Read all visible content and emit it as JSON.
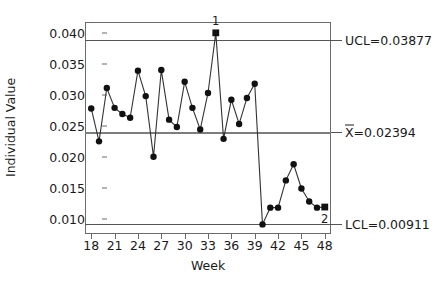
{
  "chart_data": {
    "type": "line",
    "title": "",
    "xlabel": "Week",
    "ylabel": "Individual Value",
    "xlim": [
      17.2,
      48.8
    ],
    "ylim": [
      0.00755,
      0.04175
    ],
    "grid": false,
    "legend": "none",
    "x_tick_labels": [
      "18",
      "21",
      "24",
      "27",
      "30",
      "33",
      "36",
      "39",
      "42",
      "45",
      "48"
    ],
    "x_ticks": [
      18,
      21,
      24,
      27,
      30,
      33,
      36,
      39,
      42,
      45,
      48
    ],
    "y_tick_labels": [
      "0.040",
      "0.035",
      "0.030",
      "0.025",
      "0.020",
      "0.015",
      "0.010"
    ],
    "y_ticks": [
      0.04,
      0.035,
      0.03,
      0.025,
      0.02,
      0.015,
      0.01
    ],
    "x": [
      18,
      19,
      20,
      21,
      22,
      23,
      24,
      25,
      26,
      27,
      28,
      29,
      30,
      31,
      32,
      33,
      34,
      35,
      36,
      37,
      38,
      39,
      40,
      41,
      42,
      43,
      44,
      45,
      46,
      47,
      48
    ],
    "values": [
      0.0278,
      0.0225,
      0.0311,
      0.0279,
      0.0269,
      0.0263,
      0.0339,
      0.0298,
      0.02,
      0.034,
      0.026,
      0.0248,
      0.0321,
      0.0279,
      0.0244,
      0.0303,
      0.04,
      0.0229,
      0.0292,
      0.0253,
      0.0295,
      0.0318,
      0.0091,
      0.0118,
      0.0118,
      0.0162,
      0.0188,
      0.0149,
      0.0128,
      0.0118,
      0.0119
    ],
    "series": [
      {
        "name": "Individual Value",
        "values": [
          0.0278,
          0.0225,
          0.0311,
          0.0279,
          0.0269,
          0.0263,
          0.0339,
          0.0298,
          0.02,
          0.034,
          0.026,
          0.0248,
          0.0321,
          0.0279,
          0.0244,
          0.0303,
          0.04,
          0.0229,
          0.0292,
          0.0253,
          0.0295,
          0.0318,
          0.0091,
          0.0118,
          0.0118,
          0.0162,
          0.0188,
          0.0149,
          0.0128,
          0.0118,
          0.0119
        ]
      }
    ],
    "control_limits": {
      "ucl": 0.03877,
      "center": 0.02394,
      "lcl": 0.00911
    },
    "annotations": [
      {
        "text": "1",
        "x": 34,
        "y": 0.04,
        "position": "above"
      },
      {
        "text": "2",
        "x": 48,
        "y": 0.0119,
        "position": "below"
      }
    ],
    "violation_points": [
      {
        "x": 34,
        "y": 0.04,
        "marker": "square",
        "label": "1"
      },
      {
        "x": 48,
        "y": 0.0119,
        "marker": "square",
        "label": "2"
      }
    ],
    "marker": "filled-circle",
    "marker_color": "#111111",
    "line_color": "#333333"
  },
  "labels": {
    "ucl": "UCL=0.03877",
    "center_prefix": "X",
    "center_suffix": "=0.02394",
    "lcl": "LCL=0.00911"
  },
  "colors": {
    "background": "#ffffff",
    "axis": "#6b6b6b",
    "limit_line": "#555555",
    "center_line": "#7d7d7d",
    "series_line": "#333333",
    "marker": "#111111",
    "text": "#1a1a1a"
  }
}
